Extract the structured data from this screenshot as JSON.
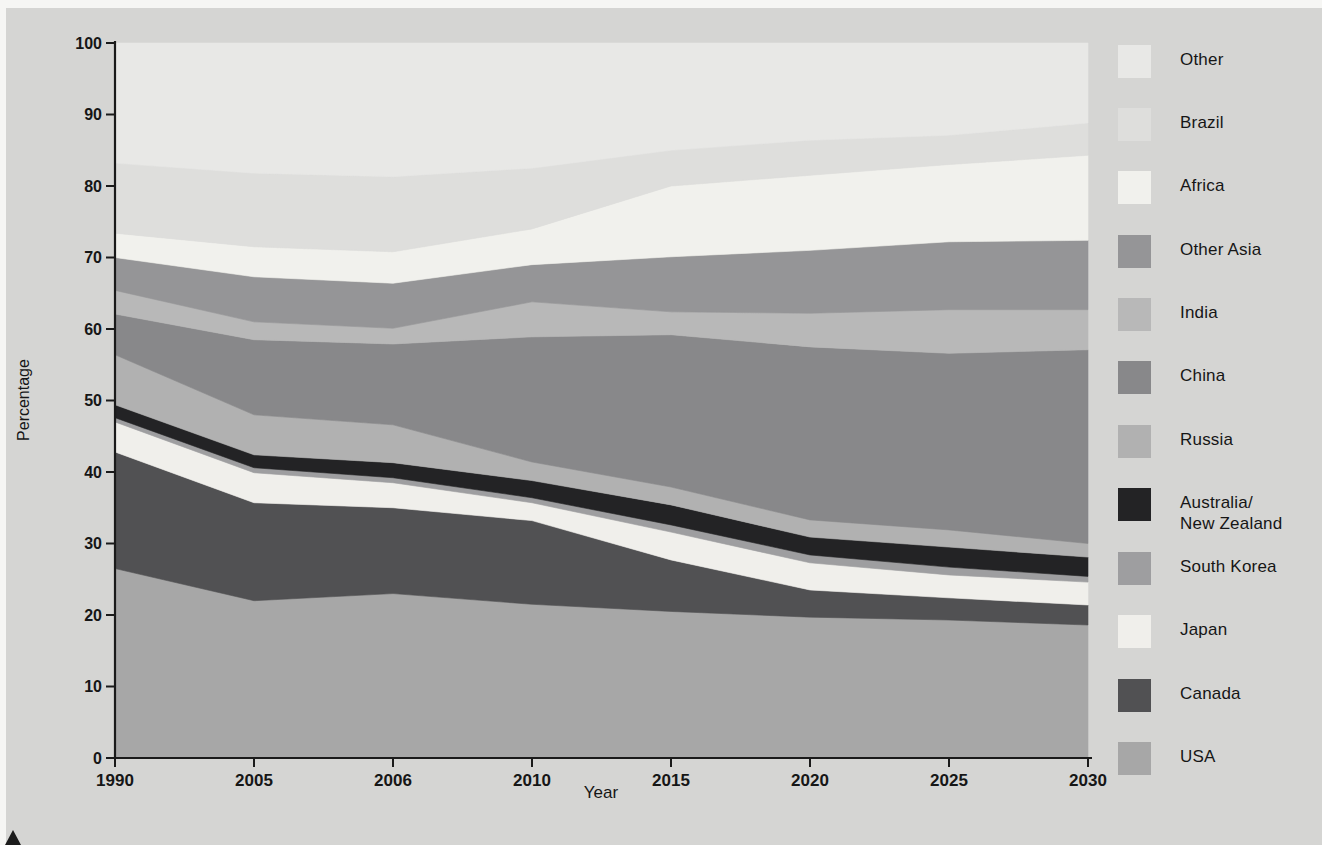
{
  "page": {
    "background": "#d5d5d3",
    "margin_color": "#f6f6f4"
  },
  "labels": {
    "percentage": "Percentage",
    "year": "Year"
  },
  "chart_data": {
    "type": "area",
    "stacked": true,
    "title": "",
    "xlabel": "Year",
    "ylabel": "Percentage",
    "x_categories": [
      "1990",
      "2005",
      "2006",
      "2010",
      "2015",
      "2020",
      "2025",
      "2030"
    ],
    "ylim": [
      0,
      100
    ],
    "yticks": [
      "0",
      "10",
      "20",
      "30",
      "40",
      "50",
      "60",
      "70",
      "80",
      "90",
      "100"
    ],
    "grid": false,
    "legend_position": "right",
    "series": [
      {
        "name": "USA",
        "color": "#a7a7a7",
        "values": [
          26.5,
          22.0,
          23.0,
          21.5,
          20.5,
          19.7,
          19.3,
          18.6
        ]
      },
      {
        "name": "Canada",
        "color": "#515153",
        "values": [
          16.3,
          13.7,
          12.0,
          11.7,
          7.2,
          3.8,
          3.1,
          2.8
        ]
      },
      {
        "name": "Japan",
        "color": "#f0efeb",
        "values": [
          4.2,
          4.2,
          3.5,
          2.5,
          3.9,
          3.8,
          3.2,
          3.2
        ]
      },
      {
        "name": "South Korea",
        "color": "#9e9ea0",
        "values": [
          0.6,
          0.7,
          0.7,
          0.7,
          1.0,
          1.1,
          1.1,
          0.8
        ]
      },
      {
        "name": "Australia/New Zealand",
        "color": "#232325",
        "values": [
          1.8,
          1.8,
          2.1,
          2.4,
          2.8,
          2.5,
          2.8,
          2.7
        ]
      },
      {
        "name": "Russia",
        "color": "#b1b1b1",
        "values": [
          7.0,
          5.6,
          5.3,
          2.6,
          2.5,
          2.4,
          2.4,
          1.9
        ]
      },
      {
        "name": "China",
        "color": "#88888a",
        "values": [
          5.7,
          10.5,
          11.3,
          17.5,
          21.3,
          24.2,
          24.7,
          27.1
        ]
      },
      {
        "name": "India",
        "color": "#b8b8b8",
        "values": [
          3.3,
          2.5,
          2.2,
          4.9,
          3.2,
          4.7,
          6.1,
          5.6
        ]
      },
      {
        "name": "Other Asia",
        "color": "#959597",
        "values": [
          4.6,
          6.3,
          6.3,
          5.2,
          7.7,
          8.8,
          9.5,
          9.7
        ]
      },
      {
        "name": "Africa",
        "color": "#f1f1ed",
        "values": [
          3.4,
          4.2,
          4.4,
          5.0,
          9.9,
          10.5,
          10.8,
          11.9
        ]
      },
      {
        "name": "Brazil",
        "color": "#dededc",
        "values": [
          9.8,
          10.3,
          10.5,
          8.5,
          5.0,
          4.9,
          4.1,
          4.5
        ]
      },
      {
        "name": "Other",
        "color": "#e8e8e6",
        "values": [
          16.8,
          18.2,
          18.7,
          17.5,
          15.0,
          13.6,
          12.9,
          11.2
        ]
      }
    ]
  },
  "legend": {
    "items": [
      {
        "label": "Other",
        "color": "#e8e8e6",
        "top": 45
      },
      {
        "label": "Brazil",
        "color": "#dededc",
        "top": 108
      },
      {
        "label": "Africa",
        "color": "#f1f1ed",
        "top": 171
      },
      {
        "label": "Other Asia",
        "color": "#959597",
        "top": 235
      },
      {
        "label": "India",
        "color": "#b8b8b8",
        "top": 298
      },
      {
        "label": "China",
        "color": "#88888a",
        "top": 361
      },
      {
        "label": "Russia",
        "color": "#b1b1b1",
        "top": 425
      },
      {
        "label": "Australia/\nNew Zealand",
        "color": "#232325",
        "top": 488
      },
      {
        "label": "South Korea",
        "color": "#9e9ea0",
        "top": 552
      },
      {
        "label": "Japan",
        "color": "#f0efeb",
        "top": 615
      },
      {
        "label": "Canada",
        "color": "#515153",
        "top": 679
      },
      {
        "label": "USA",
        "color": "#a7a7a7",
        "top": 742
      }
    ]
  }
}
